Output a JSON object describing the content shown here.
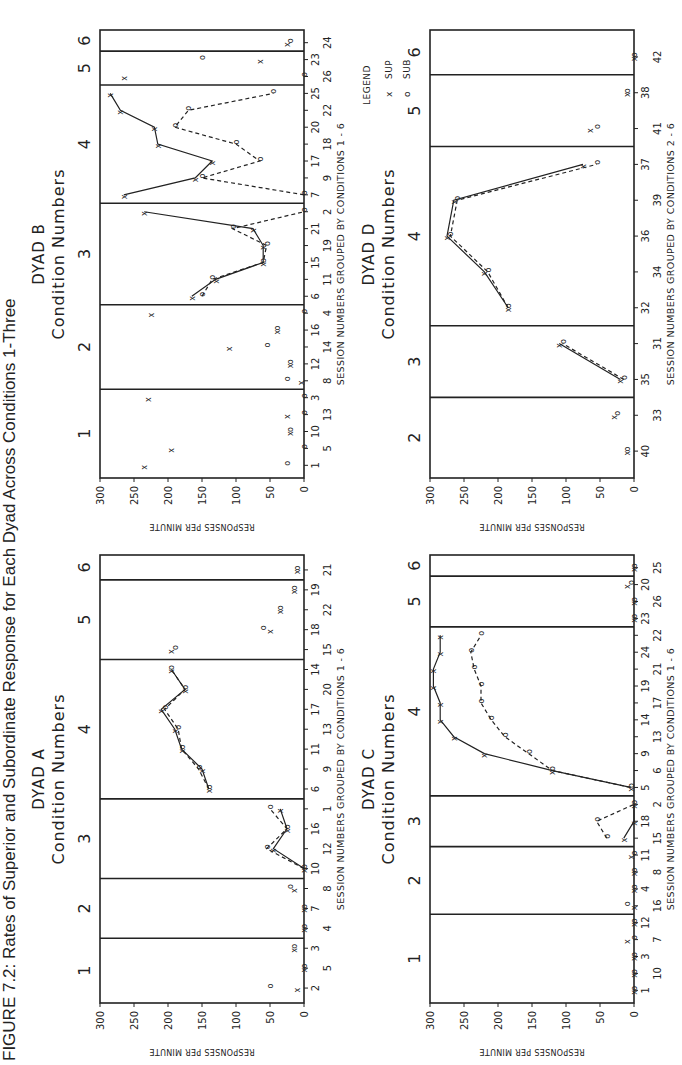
{
  "caption": "FIGURE 7.2: Rates of Superior and Subordinate Response for Each Dyad Across Conditions 1-Three",
  "legend": {
    "title": "LEGEND",
    "items": [
      {
        "label": "SUP",
        "marker": "x"
      },
      {
        "label": "SUB",
        "marker": "o"
      }
    ]
  },
  "common": {
    "ylabel": "RESPONSES PER MINUTE",
    "condition_heading": "Condition Numbers",
    "yticks": [
      0,
      50,
      100,
      150,
      200,
      250,
      300
    ]
  },
  "chart_data": [
    {
      "type": "line",
      "title": "DYAD A",
      "subtitle": "Condition Numbers",
      "xlabel": "SESSION NUMBERS GROUPED BY CONDITIONS 1 - 6",
      "ylabel": "RESPONSES PER MINUTE",
      "ylim": [
        0,
        300
      ],
      "conditions": [
        "1",
        "2",
        "3",
        "4",
        "5",
        "6"
      ],
      "condition_breaks": [
        2,
        5,
        9,
        16,
        20
      ],
      "categories": [
        "2",
        "5",
        "3",
        "4",
        "7",
        "8",
        "10",
        "12",
        "16",
        "1",
        "6",
        "9",
        "11",
        "13",
        "17",
        "20",
        "14",
        "15",
        "18",
        "22",
        "19",
        "21"
      ],
      "connected_conditions": [
        "3",
        "4"
      ],
      "series": [
        {
          "name": "SUP",
          "marker": "x",
          "values": [
            10,
            0,
            15,
            0,
            0,
            15,
            0,
            45,
            25,
            35,
            140,
            150,
            180,
            190,
            210,
            175,
            195,
            195,
            50,
            35,
            15,
            10
          ]
        },
        {
          "name": "SUB",
          "marker": "o",
          "values": [
            50,
            0,
            15,
            0,
            0,
            20,
            0,
            55,
            25,
            50,
            140,
            155,
            180,
            185,
            205,
            175,
            195,
            190,
            60,
            35,
            15,
            10
          ]
        }
      ],
      "grid": false,
      "legend_position": "none"
    },
    {
      "type": "line",
      "title": "DYAD B",
      "subtitle": "Condition Numbers",
      "xlabel": "SESSION NUMBERS GROUPED BY CONDITIONS 1 - 6",
      "ylabel": "RESPONSES PER MINUTE",
      "ylim": [
        0,
        300
      ],
      "conditions": [
        "1",
        "2",
        "3",
        "4",
        "5",
        "6"
      ],
      "condition_breaks": [
        4,
        9,
        15,
        22,
        24
      ],
      "categories": [
        "1",
        "5",
        "10",
        "13",
        "3",
        "8",
        "12",
        "14",
        "16",
        "4",
        "6",
        "11",
        "15",
        "19",
        "21",
        "2",
        "7",
        "9",
        "17",
        "18",
        "20",
        "22",
        "25",
        "26",
        "23",
        "24"
      ],
      "connected_conditions": [
        "3",
        "4"
      ],
      "series": [
        {
          "name": "SUP",
          "marker": "x",
          "values": [
            235,
            195,
            20,
            25,
            230,
            5,
            20,
            110,
            40,
            225,
            165,
            130,
            60,
            60,
            75,
            235,
            265,
            160,
            135,
            215,
            220,
            270,
            285,
            265,
            65,
            25
          ]
        },
        {
          "name": "SUB",
          "marker": "o",
          "values": [
            25,
            0,
            20,
            0,
            0,
            25,
            20,
            55,
            40,
            0,
            150,
            135,
            60,
            55,
            105,
            0,
            0,
            150,
            65,
            100,
            190,
            170,
            45,
            0,
            150,
            20
          ]
        }
      ],
      "grid": false,
      "legend_position": "none"
    },
    {
      "type": "line",
      "title": "DYAD C",
      "subtitle": "Condition Numbers",
      "xlabel": "SESSION NUMBERS GROUPED BY CONDITIONS 1 - 6",
      "ylabel": "RESPONSES PER MINUTE",
      "ylim": [
        0,
        300
      ],
      "conditions": [
        "1",
        "2",
        "3",
        "4",
        "5",
        "6"
      ],
      "condition_breaks": [
        4,
        8,
        11,
        21,
        24
      ],
      "categories": [
        "1",
        "10",
        "3",
        "7",
        "12",
        "16",
        "4",
        "8",
        "11",
        "15",
        "18",
        "2",
        "5",
        "6",
        "9",
        "13",
        "14",
        "17",
        "19",
        "21",
        "24",
        "22",
        "23",
        "26",
        "20",
        "25"
      ],
      "connected_conditions": [
        "3",
        "4"
      ],
      "series": [
        {
          "name": "SUP",
          "marker": "x",
          "values": [
            0,
            0,
            0,
            10,
            0,
            0,
            0,
            0,
            5,
            15,
            0,
            0,
            5,
            120,
            220,
            265,
            285,
            285,
            295,
            295,
            285,
            285,
            0,
            0,
            10,
            0
          ]
        },
        {
          "name": "SUB",
          "marker": "o",
          "values": [
            0,
            0,
            0,
            0,
            0,
            10,
            0,
            0,
            0,
            40,
            55,
            0,
            5,
            120,
            155,
            190,
            210,
            225,
            225,
            235,
            240,
            225,
            0,
            0,
            5,
            0
          ]
        }
      ],
      "grid": false,
      "legend_position": "none"
    },
    {
      "type": "line",
      "title": "DYAD D",
      "subtitle": "Condition Numbers",
      "xlabel": "SESSION NUMBERS GROUPED BY CONDITIONS 2 - 6",
      "ylabel": "RESPONSES PER MINUTE",
      "ylim": [
        0,
        300
      ],
      "conditions": [
        "2",
        "3",
        "4",
        "5",
        "6"
      ],
      "condition_breaks": [
        1,
        3,
        8,
        10
      ],
      "categories": [
        "40",
        "33",
        "35",
        "31",
        "32",
        "34",
        "36",
        "39",
        "37",
        "41",
        "38",
        "42"
      ],
      "connected_conditions": [
        "3",
        "4"
      ],
      "series": [
        {
          "name": "SUP",
          "marker": "x",
          "values": [
            10,
            30,
            20,
            110,
            185,
            220,
            275,
            265,
            75,
            65,
            10,
            0
          ]
        },
        {
          "name": "SUB",
          "marker": "o",
          "values": [
            10,
            25,
            15,
            105,
            185,
            215,
            270,
            260,
            55,
            55,
            10,
            0
          ]
        }
      ],
      "grid": false,
      "legend_position": "upper-right"
    }
  ]
}
